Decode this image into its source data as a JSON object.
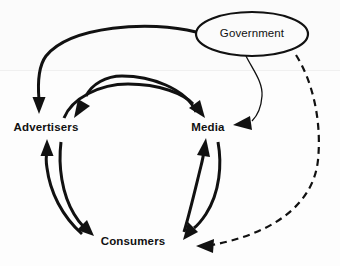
{
  "diagram": {
    "background_color": "#fdfdfd",
    "stroke_color": "#111111",
    "nodes": [
      {
        "id": "government",
        "label": "Government",
        "shape": "ellipse",
        "bold": false,
        "cx": 252,
        "cy": 34,
        "rx": 56,
        "ry": 22
      },
      {
        "id": "advertisers",
        "label": "Advertisers",
        "shape": "text",
        "bold": true,
        "cx": 46,
        "cy": 128
      },
      {
        "id": "media",
        "label": "Media",
        "shape": "text",
        "bold": true,
        "cx": 208,
        "cy": 128
      },
      {
        "id": "consumers",
        "label": "Consumers",
        "shape": "text",
        "bold": true,
        "cx": 133,
        "cy": 242
      }
    ],
    "edges": [
      {
        "id": "government-to-advertisers",
        "from": "government",
        "to": "advertisers",
        "style": "solid",
        "weight": "thick",
        "arrow": "single"
      },
      {
        "id": "government-to-media",
        "from": "government",
        "to": "media",
        "style": "solid",
        "weight": "thin",
        "arrow": "single"
      },
      {
        "id": "government-to-consumers",
        "from": "government",
        "to": "consumers",
        "style": "dashed",
        "weight": "medium",
        "arrow": "single"
      },
      {
        "id": "advertisers-to-media",
        "from": "advertisers",
        "to": "media",
        "style": "solid",
        "weight": "thick",
        "arrow": "single"
      },
      {
        "id": "media-to-advertisers",
        "from": "media",
        "to": "advertisers",
        "style": "solid",
        "weight": "thick",
        "arrow": "single"
      },
      {
        "id": "advertisers-to-consumers",
        "from": "advertisers",
        "to": "consumers",
        "style": "solid",
        "weight": "thick",
        "arrow": "single"
      },
      {
        "id": "consumers-to-advertisers",
        "from": "consumers",
        "to": "advertisers",
        "style": "solid",
        "weight": "thick",
        "arrow": "single"
      },
      {
        "id": "media-to-consumers",
        "from": "media",
        "to": "consumers",
        "style": "solid",
        "weight": "thick",
        "arrow": "single"
      },
      {
        "id": "consumers-to-media",
        "from": "consumers",
        "to": "media",
        "style": "solid",
        "weight": "thick",
        "arrow": "single"
      }
    ]
  }
}
